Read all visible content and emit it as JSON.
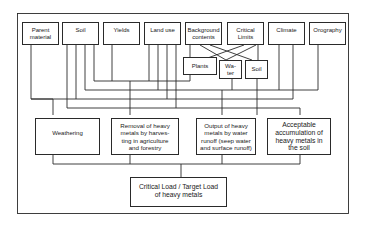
{
  "diagram": {
    "top_row": [
      {
        "id": "parent-material",
        "label": "Parent\nmaterial"
      },
      {
        "id": "soil",
        "label": "Soil"
      },
      {
        "id": "yields",
        "label": "Yields"
      },
      {
        "id": "land-use",
        "label": "Land use"
      },
      {
        "id": "background-contents",
        "label": "Background\ncontents"
      },
      {
        "id": "critical-limits",
        "label": "Critical\nLimits"
      },
      {
        "id": "climate",
        "label": "Climate"
      },
      {
        "id": "orography",
        "label": "Orography"
      }
    ],
    "sub_row": [
      {
        "id": "plants",
        "label": "Plants"
      },
      {
        "id": "water",
        "label": "Wa-\nter"
      },
      {
        "id": "soil-sub",
        "label": "Soil"
      }
    ],
    "process_row": [
      {
        "id": "weathering",
        "label": "Weathering"
      },
      {
        "id": "removal",
        "label": "Removal of heavy\nmetals by harves-\nting in agriculture\nand forestry"
      },
      {
        "id": "output",
        "label": "Output of heavy\nmetals by water\nrunoff (seep water\nand surface runoff)"
      },
      {
        "id": "acceptable",
        "label": "Acceptable\naccumulation of\nheavy metals in\nthe soil"
      }
    ],
    "result": {
      "id": "critical-load",
      "label": "Critical Load / Target Load\nof heavy metals"
    }
  },
  "colors": {
    "line": "#2a2a2a",
    "background": "#ffffff"
  }
}
